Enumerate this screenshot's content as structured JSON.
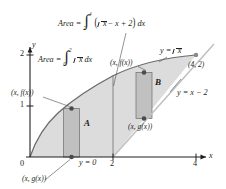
{
  "figure": {
    "kind": "area-between-curves-diagram",
    "axes": {
      "x_label": "x",
      "y_label": "y",
      "x_ticks": [
        {
          "value": 0,
          "label": "0"
        },
        {
          "value": 2,
          "label": "2"
        },
        {
          "value": 4,
          "label": "4"
        }
      ],
      "y_ticks": [
        {
          "value": 1,
          "label": "1"
        },
        {
          "value": 2,
          "label": "2"
        }
      ],
      "x_range": [
        0,
        4.6
      ],
      "y_range": [
        0,
        2.35
      ]
    },
    "curves": [
      {
        "name": "sqrt-curve",
        "label": "y = √x",
        "label_prefix": "y =",
        "label_radicand": "x",
        "expression": "sqrt(x)"
      },
      {
        "name": "line-curve",
        "label": "y = x − 2",
        "expression": "x - 2"
      },
      {
        "name": "x-axis-line",
        "label": "y = 0",
        "expression": "0"
      }
    ],
    "regions": [
      {
        "name": "region-a",
        "label": "A"
      },
      {
        "name": "region-b",
        "label": "B"
      }
    ],
    "points": [
      {
        "name": "intersection-point",
        "label": "(4, 2)",
        "x": 4,
        "y": 2
      },
      {
        "name": "left-rect-top-point",
        "label": "(x, f(x))",
        "x": 0.9,
        "y": 0.95
      },
      {
        "name": "left-rect-bottom-point",
        "label": "(x, g(x))",
        "x": 0.9,
        "y": 0
      },
      {
        "name": "right-rect-top-point",
        "label": "(x, f(x))",
        "x": 2.75,
        "y": 1.66
      },
      {
        "name": "right-rect-bottom-point",
        "label": "(x, g(x))",
        "x": 2.75,
        "y": 0.75
      }
    ],
    "annotations": {
      "area_a": {
        "name": "area-a-formula",
        "prefix": "Area =",
        "lower_limit": "0",
        "upper_limit": "2",
        "integrand_radicand": "x",
        "differential": "dx",
        "full_text": "Area = ∫₀² √x dx"
      },
      "area_b": {
        "name": "area-b-formula",
        "prefix": "Area =",
        "lower_limit": "2",
        "upper_limit": "4",
        "integrand_radicand": "x",
        "integrand_rest": "− x + 2",
        "differential": "dx",
        "full_text": "Area = ∫₂⁴ (√x − x + 2) dx"
      }
    },
    "colors": {
      "fill_light": "#dcdcdc",
      "fill_rect": "#c4c4c4",
      "stroke": "#5a5a5a",
      "ink": "#231f20",
      "line_light": "#b8b8b8"
    }
  }
}
